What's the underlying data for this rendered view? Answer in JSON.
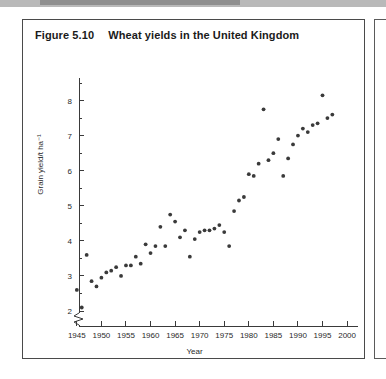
{
  "figure": {
    "number": "Figure 5.10",
    "caption": "Wheat yields in the United Kingdom"
  },
  "colors": {
    "point": "#3a3a3a",
    "axis": "#3a3a3a",
    "border": "#4a4a4a",
    "text": "#1a1a1a",
    "background": "#ffffff",
    "scan_band": "#b9b9b9"
  },
  "chart_data": {
    "type": "scatter",
    "title": "Wheat yields in the United Kingdom",
    "xlabel": "Year",
    "ylabel": "Grain yield/t ha⁻¹",
    "xlim": [
      1943,
      2001
    ],
    "ylim": [
      1.75,
      8.6
    ],
    "grid": false,
    "legend": null,
    "y_axis_break": true,
    "y_break_note": "zigzag break between 0 and 2 on the y-axis",
    "xticks": [
      1945,
      1950,
      1955,
      1960,
      1965,
      1970,
      1975,
      1980,
      1985,
      1990,
      1995,
      2000
    ],
    "xtick_labels": [
      "1945",
      "1950",
      "1955",
      "1960",
      "1965",
      "1970",
      "1975",
      "1980",
      "1985",
      "1990",
      "1995",
      "2000"
    ],
    "yticks": [
      2,
      3,
      4,
      5,
      6,
      7,
      8
    ],
    "ytick_labels": [
      "2",
      "3",
      "4",
      "5",
      "6",
      "7",
      "8"
    ],
    "yticks_minor": [
      2.5,
      3.5,
      4.5,
      5.5,
      6.5,
      7.5,
      8.5
    ],
    "x": [
      1945,
      1946,
      1947,
      1948,
      1949,
      1950,
      1951,
      1952,
      1953,
      1954,
      1955,
      1956,
      1957,
      1958,
      1959,
      1960,
      1961,
      1962,
      1963,
      1964,
      1965,
      1966,
      1967,
      1968,
      1969,
      1970,
      1971,
      1972,
      1973,
      1974,
      1975,
      1976,
      1977,
      1978,
      1979,
      1980,
      1981,
      1982,
      1983,
      1984,
      1985,
      1986,
      1987,
      1988,
      1989,
      1990,
      1991,
      1992,
      1993,
      1994,
      1995,
      1996,
      1997
    ],
    "y": [
      2.6,
      2.1,
      3.6,
      2.85,
      2.7,
      2.95,
      3.1,
      3.15,
      3.25,
      3.0,
      3.3,
      3.3,
      3.55,
      3.35,
      3.9,
      3.65,
      3.85,
      4.4,
      3.85,
      4.75,
      4.55,
      4.1,
      4.3,
      3.55,
      4.05,
      4.25,
      4.3,
      4.3,
      4.35,
      4.45,
      4.25,
      3.85,
      4.85,
      5.15,
      5.25,
      5.9,
      5.85,
      6.2,
      7.75,
      6.3,
      6.5,
      6.9,
      5.85,
      6.35,
      6.75,
      7.0,
      7.2,
      7.1,
      7.3,
      7.35,
      8.15,
      7.5,
      7.6
    ]
  }
}
